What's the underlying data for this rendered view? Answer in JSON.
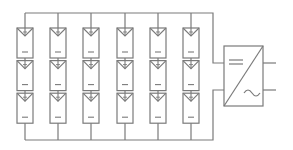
{
  "diagram": {
    "colors": {
      "stroke": "#7a7a7a",
      "background": "#ffffff"
    },
    "array": {
      "strings": 6,
      "modules_per_string": 3,
      "module_polarity_top": "+",
      "module_polarity_bottom": "-"
    },
    "inverter": {
      "dc_symbol": "=",
      "ac_symbol": "~"
    }
  }
}
